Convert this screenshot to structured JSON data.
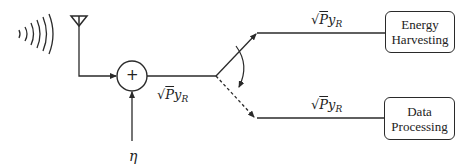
{
  "diagram": {
    "colors": {
      "stroke": "#2a2a2a",
      "text": "#222222",
      "background": "#ffffff"
    },
    "icons": {
      "signal": "wireless-signal-icon",
      "antenna": "antenna-icon"
    },
    "adder": {
      "symbol": "+"
    },
    "noise": {
      "label": "η"
    },
    "signals": {
      "combined": {
        "radical": "√",
        "base": "P",
        "var": "y",
        "sub": "R"
      },
      "upper": {
        "radical": "√",
        "base": "P",
        "var": "y",
        "sub": "R"
      },
      "lower": {
        "radical": "√",
        "base": "P",
        "var": "y",
        "sub": "R"
      }
    },
    "blocks": {
      "energy": {
        "line1": "Energy",
        "line2": "Harvesting"
      },
      "data": {
        "line1": "Data",
        "line2": "Processing"
      }
    }
  }
}
